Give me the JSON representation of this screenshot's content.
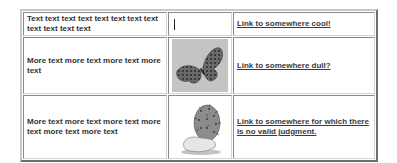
{
  "table": {
    "rows": [
      {
        "text": "Text text  text text text text text text text text text text",
        "image": {
          "icon": "text-cursor-icon",
          "kind": "empty"
        },
        "link": "Link to somewhere cool!"
      },
      {
        "text": "More text more text more text more text",
        "image": {
          "icon": "butterfly-icon",
          "kind": "butterfly"
        },
        "link": "Link to somewhere dull?"
      },
      {
        "text": "More text more text more text more text more text more text",
        "image": {
          "icon": "cactus-icon",
          "kind": "cactus"
        },
        "link": "Link to somewhere for which there is no valid judgment."
      }
    ]
  },
  "colors": {
    "text": "#333333",
    "link": "#3a3a3a",
    "border_light": "#c8c8c8",
    "border_dark": "#6e6e6e",
    "butterfly_bg": "#c4c4c4"
  }
}
